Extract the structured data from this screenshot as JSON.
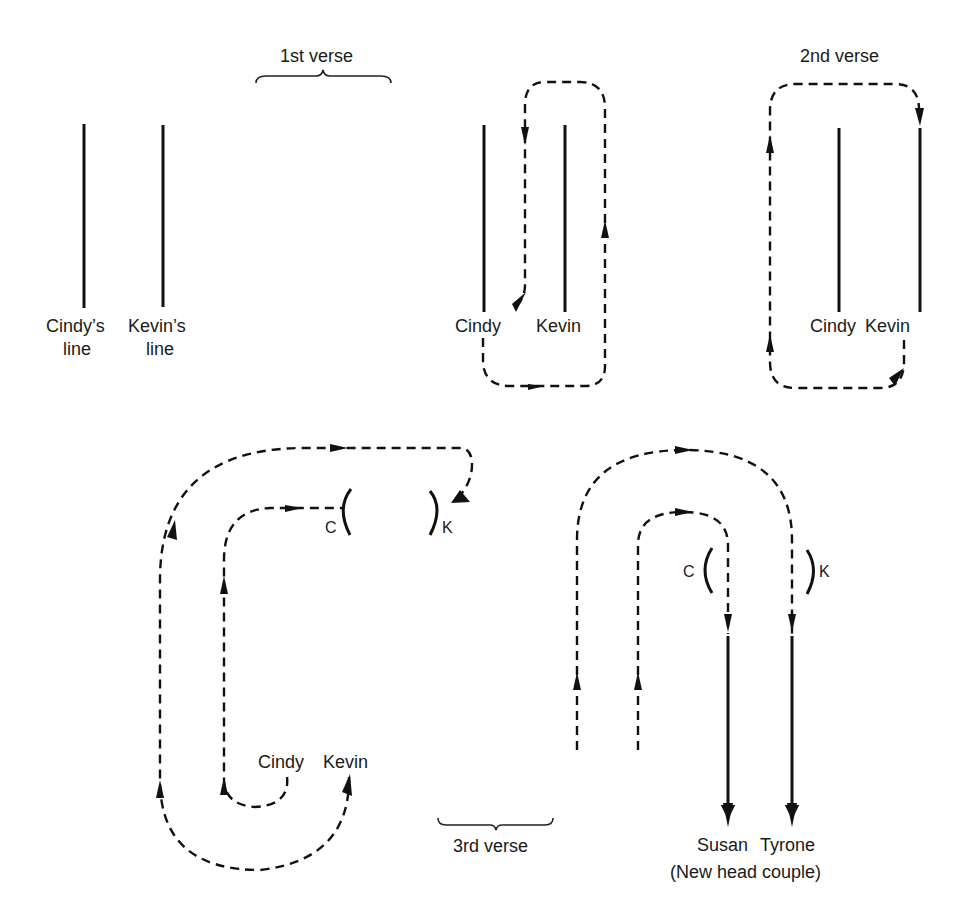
{
  "diagram": {
    "panel_start": {
      "labels": {
        "cindy_line_1": "Cindy’s",
        "cindy_line_2": "line",
        "kevin_line_1": "Kevin’s",
        "kevin_line_2": "line"
      }
    },
    "verse_1": {
      "label": "1st verse",
      "labels": {
        "cindy": "Cindy",
        "kevin": "Kevin"
      }
    },
    "verse_2": {
      "label": "2nd verse",
      "labels": {
        "cindy": "Cindy",
        "kevin": "Kevin"
      }
    },
    "verse_3a": {
      "labels": {
        "c": "C",
        "k": "K",
        "cindy": "Cindy",
        "kevin": "Kevin"
      }
    },
    "verse_3": {
      "label": "3rd verse"
    },
    "verse_3b": {
      "labels": {
        "c": "C",
        "k": "K",
        "susan": "Susan",
        "tyrone": "Tyrone",
        "new_head": "(New head couple)"
      }
    },
    "colors": {
      "ink": "#111111",
      "background": "#ffffff"
    }
  }
}
